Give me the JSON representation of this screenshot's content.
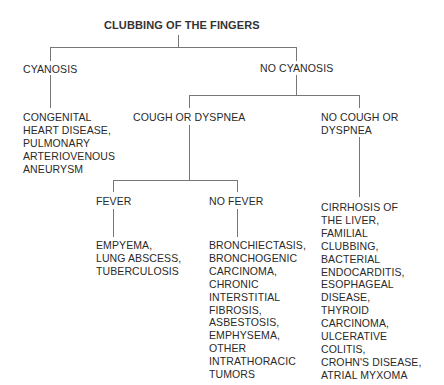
{
  "diagram": {
    "title": "CLUBBING OF THE FINGERS",
    "nodes": {
      "cyanosis": "CYANOSIS",
      "no_cyanosis": "NO CYANOSIS",
      "cyanosis_causes": "CONGENITAL\nHEART DISEASE,\nPULMONARY\nARTERIOVENOUS\nANEURYSM",
      "cough_or_dyspnea": "COUGH OR DYSPNEA",
      "no_cough_or_dyspnea": "NO COUGH OR\nDYSPNEA",
      "fever": "FEVER",
      "no_fever": "NO FEVER",
      "fever_causes": "EMPYEMA,\nLUNG ABSCESS,\nTUBERCULOSIS",
      "no_fever_causes": "BRONCHIECTASIS,\nBRONCHOGENIC\nCARCINOMA,\nCHRONIC\nINTERSTITIAL\nFIBROSIS,\nASBESTOSIS,\nEMPHYSEMA,\nOTHER\nINTRATHORACIC\nTUMORS",
      "no_cough_causes": "CIRRHOSIS OF\nTHE LIVER,\nFAMILIAL\nCLUBBING,\nBACTERIAL\nENDOCARDITIS,\nESOPHAGEAL\nDISEASE,\nTHYROID\nCARCINOMA,\nULCERATIVE\nCOLITIS,\nCROHN'S DISEASE,\nATRIAL MYXOMA"
    },
    "edges": [
      [
        "title",
        "cyanosis"
      ],
      [
        "title",
        "no_cyanosis"
      ],
      [
        "cyanosis",
        "cyanosis_causes"
      ],
      [
        "no_cyanosis",
        "cough_or_dyspnea"
      ],
      [
        "no_cyanosis",
        "no_cough_or_dyspnea"
      ],
      [
        "cough_or_dyspnea",
        "fever"
      ],
      [
        "cough_or_dyspnea",
        "no_fever"
      ],
      [
        "fever",
        "fever_causes"
      ],
      [
        "no_fever",
        "no_fever_causes"
      ],
      [
        "no_cough_or_dyspnea",
        "no_cough_causes"
      ]
    ]
  }
}
